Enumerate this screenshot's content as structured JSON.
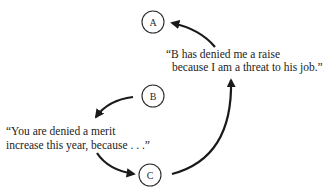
{
  "diagram": {
    "nodes": [
      {
        "id": "A",
        "label": "A",
        "cx": 153,
        "cy": 22,
        "r": 11
      },
      {
        "id": "B",
        "label": "B",
        "cx": 153,
        "cy": 96,
        "r": 11
      },
      {
        "id": "C",
        "label": "C",
        "cx": 150,
        "cy": 175,
        "r": 11
      }
    ],
    "quotes": {
      "a_perception": {
        "line1": "“B has denied me a raise",
        "line2": "because I am a threat to his job.”"
      },
      "b_message": {
        "line1": "“You are denied a merit",
        "line2": "increase this year, because . . .”"
      }
    },
    "edges": [
      {
        "from": "B",
        "to": "b_message"
      },
      {
        "from": "b_message",
        "to": "C"
      },
      {
        "from": "C",
        "to": "a_perception"
      },
      {
        "from": "a_perception",
        "to": "A"
      }
    ],
    "colors": {
      "ink": "#1a1a1a",
      "background": "#ffffff"
    }
  }
}
